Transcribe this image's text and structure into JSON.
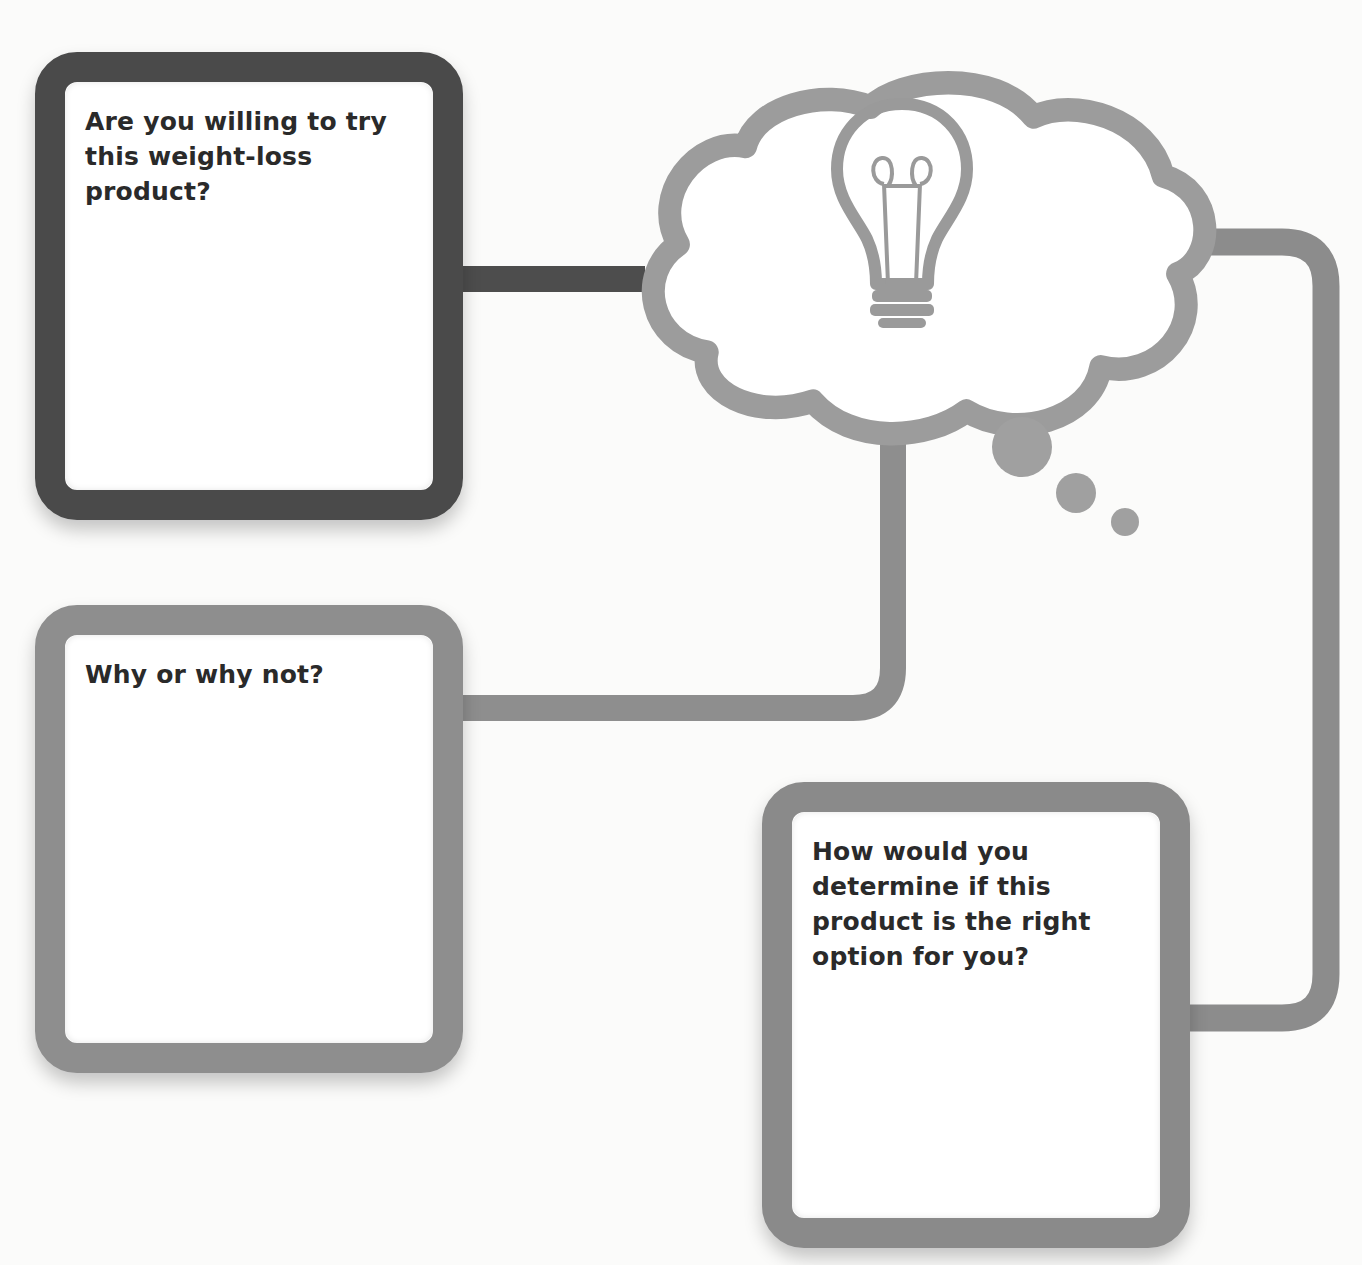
{
  "diagram": {
    "type": "graphic-organizer",
    "theme_colors": {
      "dark_frame": "#4a4a4a",
      "gray_frame": "#8e8e8e",
      "cloud_stroke": "#9a9a9a",
      "text": "#2a2a2a",
      "background": "#fbfbfa"
    },
    "center_node": {
      "shape": "thought-cloud",
      "icon": "lightbulb-icon",
      "bubbles": 3
    },
    "boxes": [
      {
        "id": "box1",
        "question": "Are you willing to try this weight-loss product?",
        "frame": "dark",
        "connects_to": "cloud-left"
      },
      {
        "id": "box2",
        "question": "Why or why not?",
        "frame": "gray",
        "connects_to": "cloud-bottom"
      },
      {
        "id": "box3",
        "question": "How would you determine if this product is the right option for you?",
        "frame": "gray",
        "connects_to": "cloud-right"
      }
    ]
  }
}
